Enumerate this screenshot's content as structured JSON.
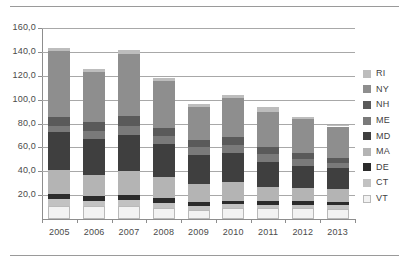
{
  "chart_data": {
    "type": "bar",
    "subtype": "stacked-vertical",
    "title": "",
    "xlabel": "",
    "ylabel": "",
    "categories": [
      "2005",
      "2006",
      "2007",
      "2008",
      "2009",
      "2010",
      "2011",
      "2012",
      "2013"
    ],
    "ylim": [
      0,
      160
    ],
    "ytick_labels": [
      "160,0",
      "140,0",
      "120,0",
      "100,0",
      "80,0",
      "60,0",
      "40,0",
      "20,0"
    ],
    "ytick_values": [
      160,
      140,
      120,
      100,
      80,
      60,
      40,
      20
    ],
    "grid": true,
    "grid_axis": "y",
    "legend_position": "right",
    "decimal_separator": ",",
    "stack_order_bottom_to_top": [
      "VT",
      "CT",
      "DE",
      "MA",
      "MD",
      "ME",
      "NH",
      "NY",
      "RI"
    ],
    "legend_order_top_to_bottom": [
      "RI",
      "NY",
      "NH",
      "ME",
      "MD",
      "MA",
      "DE",
      "CT",
      "VT"
    ],
    "series": [
      {
        "name": "VT",
        "color": "#f2f2f2",
        "values": [
          11.0,
          11.0,
          11.0,
          9.5,
          7.5,
          9.5,
          9.0,
          9.0,
          8.5
        ]
      },
      {
        "name": "CT",
        "color": "#c2c2c2",
        "values": [
          5.5,
          4.5,
          5.0,
          4.0,
          3.0,
          3.0,
          2.5,
          3.0,
          3.0
        ]
      },
      {
        "name": "DE",
        "color": "#2b2b2b",
        "values": [
          4.5,
          4.0,
          4.5,
          4.0,
          3.5,
          3.0,
          3.5,
          3.0,
          3.0
        ]
      },
      {
        "name": "MA",
        "color": "#b4b4b4",
        "values": [
          20.0,
          17.0,
          19.5,
          17.5,
          15.0,
          15.5,
          11.5,
          11.0,
          10.5
        ]
      },
      {
        "name": "MD",
        "color": "#3f3f3f",
        "values": [
          32.0,
          30.5,
          30.0,
          27.5,
          24.5,
          24.5,
          21.5,
          18.5,
          17.5
        ]
      },
      {
        "name": "ME",
        "color": "#7a7a7a",
        "values": [
          5.0,
          6.5,
          8.0,
          7.0,
          6.5,
          6.5,
          6.5,
          5.5,
          4.5
        ]
      },
      {
        "name": "NH",
        "color": "#5a5a5a",
        "values": [
          7.5,
          7.5,
          8.5,
          7.0,
          6.5,
          6.5,
          5.5,
          5.5,
          4.5
        ]
      },
      {
        "name": "NY",
        "color": "#8e8e8e",
        "values": [
          55.5,
          42.5,
          51.5,
          39.0,
          27.5,
          33.0,
          30.0,
          28.0,
          26.0
        ]
      },
      {
        "name": "RI",
        "color": "#bdbdbd",
        "values": [
          2.5,
          2.5,
          3.5,
          3.0,
          2.5,
          2.5,
          3.5,
          2.0,
          1.5
        ]
      }
    ],
    "totals": [
      143.5,
      126.0,
      131.5,
      118.5,
      96.5,
      104.0,
      93.5,
      85.5,
      79.0
    ]
  },
  "legend": {
    "items": [
      {
        "label": "RI",
        "color": "#bdbdbd"
      },
      {
        "label": "NY",
        "color": "#8e8e8e"
      },
      {
        "label": "NH",
        "color": "#5a5a5a"
      },
      {
        "label": "ME",
        "color": "#7a7a7a"
      },
      {
        "label": "MD",
        "color": "#3f3f3f"
      },
      {
        "label": "MA",
        "color": "#b4b4b4"
      },
      {
        "label": "DE",
        "color": "#2b2b2b"
      },
      {
        "label": "CT",
        "color": "#c2c2c2"
      },
      {
        "label": "VT",
        "color": "#f2f2f2"
      }
    ]
  },
  "style": {
    "background": "#ffffff",
    "gridline_color": "#a8a8a8",
    "axis_color": "#8d8d8d",
    "text_color": "#3f3f3f",
    "rule_color": "#9a9a9a"
  }
}
